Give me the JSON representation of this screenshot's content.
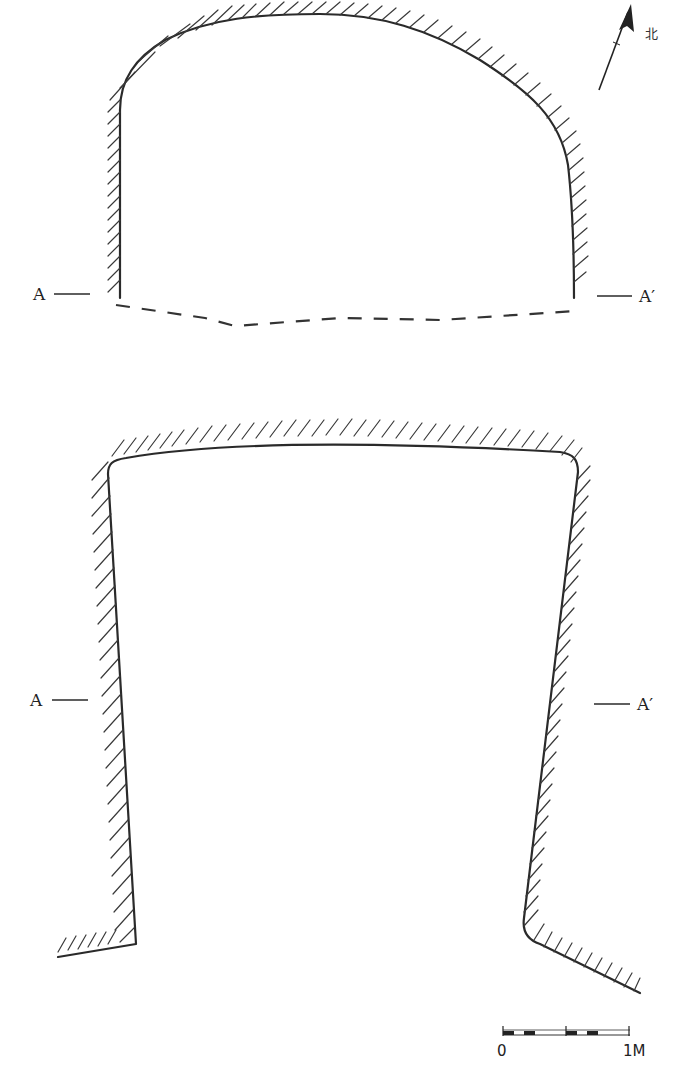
{
  "drawing": {
    "type": "archaeological plan and section",
    "north_label": "北",
    "plan": {
      "section_left_label": "A",
      "section_right_label": "A′"
    },
    "section": {
      "section_left_label": "A",
      "section_right_label": "A′"
    },
    "scale_bar": {
      "start_label": "0",
      "end_label": "1M"
    }
  },
  "colors": {
    "line": "#2a2a2a",
    "background": "#ffffff"
  }
}
